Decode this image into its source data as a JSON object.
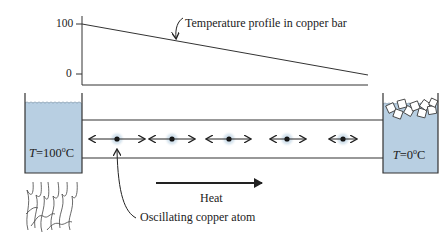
{
  "figure": {
    "type": "heat-conduction-diagram",
    "graph": {
      "y_ticks": [
        {
          "label": "100",
          "value": 100
        },
        {
          "label": "0",
          "value": 0
        }
      ],
      "profile_label": "Temperature profile in copper bar",
      "profile": {
        "start_value": 100,
        "end_value": 0
      }
    },
    "left_reservoir": {
      "var": "T",
      "eq": "=100",
      "deg": "o",
      "unit": "C",
      "heated_by": "flame"
    },
    "right_reservoir": {
      "var": "T",
      "eq": "=0",
      "deg": "o",
      "unit": "C",
      "contains": "ice cubes"
    },
    "bar": {
      "material": "copper",
      "atom_count": 5
    },
    "heat_label": "Heat",
    "atom_label": "Oscillating copper atom",
    "colors": {
      "water": "#b8cfe2",
      "line": "#333333",
      "atom_glow": "#c9dbe8"
    }
  }
}
